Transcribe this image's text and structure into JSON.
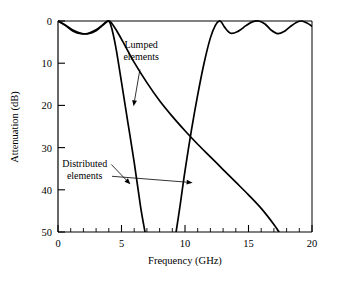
{
  "chart_data": {
    "type": "line",
    "title": "",
    "xlabel": "Frequency (GHz)",
    "ylabel": "Attenuation (dB)",
    "xlim": [
      0,
      20
    ],
    "ylim": [
      0,
      50
    ],
    "y_axis_inverted": true,
    "grid": false,
    "legend_position": "inline-annotations",
    "x_ticks_major": [
      0,
      5,
      10,
      15,
      20
    ],
    "x_tick_labels": [
      "0",
      "5",
      "10",
      "15",
      "20"
    ],
    "x_tick_minor_step": 1,
    "y_ticks_major": [
      0,
      10,
      20,
      30,
      40,
      50
    ],
    "y_tick_labels": [
      "0",
      "10",
      "20",
      "30",
      "40",
      "50"
    ],
    "line_color": "#000000",
    "series": [
      {
        "name": "Lumped elements",
        "points_x": [
          0.0,
          0.6,
          1.2,
          1.8,
          2.4,
          3.0,
          3.4,
          3.8,
          4.0,
          4.2,
          4.6,
          5.2,
          6.0,
          7.0,
          8.0,
          9.0,
          10.0,
          11.0,
          12.0,
          13.0,
          14.0,
          15.0,
          16.0,
          17.0,
          17.4
        ],
        "points_y": [
          0.0,
          1.0,
          2.2,
          2.9,
          3.0,
          2.3,
          1.3,
          0.3,
          0.0,
          0.4,
          2.2,
          5.4,
          9.8,
          14.6,
          18.9,
          22.6,
          26.0,
          29.2,
          32.2,
          35.2,
          38.2,
          41.2,
          44.4,
          48.2,
          50.0
        ]
      },
      {
        "name": "Distributed elements (lower skirt)",
        "points_x": [
          0.0,
          0.6,
          1.2,
          1.8,
          2.4,
          3.0,
          3.4,
          3.8,
          4.0,
          4.15,
          4.35,
          4.6,
          5.0,
          5.5,
          6.0,
          6.5,
          6.85
        ],
        "points_y": [
          0.0,
          1.1,
          2.4,
          3.0,
          2.9,
          2.1,
          1.2,
          0.2,
          0.0,
          0.9,
          3.2,
          7.0,
          14.5,
          24.0,
          33.5,
          44.0,
          50.0
        ]
      },
      {
        "name": "Distributed elements (upper skirt and second passband)",
        "points_x": [
          9.3,
          9.6,
          10.0,
          10.5,
          11.0,
          11.5,
          12.0,
          12.4,
          12.7,
          12.9,
          13.1,
          13.6,
          14.2,
          14.8,
          15.3,
          15.8,
          16.3,
          16.8,
          17.3,
          17.8,
          18.3,
          18.8,
          19.2,
          19.6,
          20.0
        ],
        "points_y": [
          50.0,
          44.0,
          35.5,
          26.0,
          17.5,
          10.0,
          4.0,
          1.0,
          0.0,
          0.4,
          1.4,
          2.9,
          2.4,
          1.1,
          0.2,
          0.0,
          0.7,
          2.2,
          3.0,
          2.5,
          1.3,
          0.3,
          0.0,
          0.5,
          1.2
        ]
      }
    ],
    "annotations": [
      {
        "label_line_1": "Lumped",
        "label_line_2": "elements",
        "text_x": 6.55,
        "text_y": 6.5,
        "arrow_from_x": 6.45,
        "arrow_from_y": 11.5,
        "arrow_to_x": 5.95,
        "arrow_to_y": 20.2
      },
      {
        "label_line_1": "Distributed",
        "label_line_2": "elements",
        "text_x": 2.1,
        "text_y": 34.5,
        "arrow_a_from_x": 4.2,
        "arrow_a_from_y": 34.0,
        "arrow_a_to_x": 5.7,
        "arrow_a_to_y": 38.7,
        "arrow_b_from_x": 4.25,
        "arrow_b_from_y": 36.8,
        "arrow_b_to_x": 10.6,
        "arrow_b_to_y": 38.3
      }
    ]
  }
}
